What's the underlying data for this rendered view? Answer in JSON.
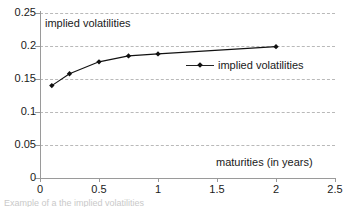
{
  "chart_data": {
    "type": "line",
    "title": "",
    "xlabel": "maturities (in years)",
    "ylabel": "implied volatilities",
    "xlim": [
      0,
      2.5
    ],
    "ylim": [
      0,
      0.25
    ],
    "grid": true,
    "grid_axis": "y",
    "legend_position": "inside-right",
    "xticks": [
      "0",
      "0.5",
      "1",
      "1.5",
      "2",
      "2.5"
    ],
    "xtick_values": [
      0,
      0.5,
      1,
      1.5,
      2,
      2.5
    ],
    "yticks": [
      "0",
      "0.05",
      "0.1",
      "0.15",
      "0.2",
      "0.25"
    ],
    "ytick_values": [
      0,
      0.05,
      0.1,
      0.15,
      0.2,
      0.25
    ],
    "series": [
      {
        "name": "implied volatilities",
        "marker": "diamond",
        "color": "#111111",
        "x": [
          0.1,
          0.25,
          0.5,
          0.75,
          1.0,
          2.0
        ],
        "values": [
          0.14,
          0.158,
          0.176,
          0.185,
          0.188,
          0.199
        ]
      }
    ]
  },
  "legend": {
    "entries": [
      {
        "label": "implied volatilities"
      }
    ]
  },
  "caption": {
    "text": "Example of a the implied volatilities"
  }
}
